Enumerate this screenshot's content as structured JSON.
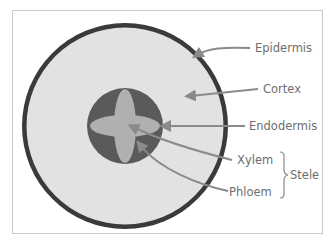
{
  "diagram": {
    "colors": {
      "frame": "#c8c8c8",
      "epidermis": "#3a3a3a",
      "cortex": "#e2e2e2",
      "endodermis": "#5a5a5a",
      "xylem": "#b0b0b0",
      "leader": "#8a8a8a",
      "text": "#6e6e6e"
    },
    "labels": {
      "epidermis": "Epidermis",
      "cortex": "Cortex",
      "endodermis": "Endodermis",
      "xylem": "Xylem",
      "phloem": "Phloem",
      "stele": "Stele"
    }
  }
}
